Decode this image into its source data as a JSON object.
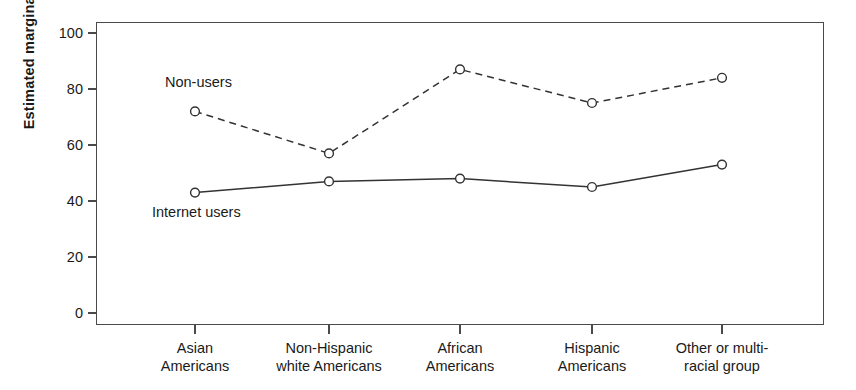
{
  "chart_data": {
    "type": "line",
    "title": "",
    "xlabel": "",
    "ylabel": "Estimated marginal means",
    "ylim": [
      0,
      105
    ],
    "yticks": [
      0,
      20,
      40,
      60,
      80,
      100
    ],
    "ytick_labels": [
      "0",
      "20",
      "40",
      "60",
      "80",
      "100"
    ],
    "grid": false,
    "legend_position": "inline-annotation",
    "categories": [
      "Asian\nAmericans",
      "Non-Hispanic\nwhite Americans",
      "African\nAmericans",
      "Hispanic\nAmericans",
      "Other or multi-\nracial group"
    ],
    "series": [
      {
        "name": "Non-users",
        "values": [
          72,
          57,
          87,
          75,
          84
        ],
        "line_style": "dashed",
        "marker": "open-circle",
        "color": "#333333"
      },
      {
        "name": "Internet users",
        "values": [
          43,
          47,
          48,
          45,
          53
        ],
        "line_style": "solid",
        "marker": "open-circle",
        "color": "#333333"
      }
    ],
    "annotations": [
      {
        "text": "Non-users",
        "series": "Non-users"
      },
      {
        "text": "Internet users",
        "series": "Internet users"
      }
    ]
  },
  "axes": {
    "y_title": "Estimated marginal means",
    "frame_color": "#4a4a4a"
  }
}
